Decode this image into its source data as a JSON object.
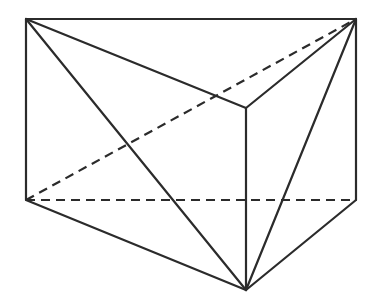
{
  "diagram": {
    "type": "geometry",
    "colors": {
      "stroke": "#2b2b2b",
      "background": "#ffffff"
    },
    "vertices": {
      "top_left": {
        "x": 26,
        "y": 19
      },
      "top_right": {
        "x": 356,
        "y": 19
      },
      "top_front": {
        "x": 246,
        "y": 108
      },
      "bottom_left": {
        "x": 26,
        "y": 200
      },
      "bottom_right": {
        "x": 356,
        "y": 200
      },
      "bottom_front": {
        "x": 246,
        "y": 290
      }
    },
    "edges": [
      {
        "from": "top_left",
        "to": "top_right",
        "style": "solid"
      },
      {
        "from": "top_left",
        "to": "top_front",
        "style": "solid"
      },
      {
        "from": "top_front",
        "to": "top_right",
        "style": "solid"
      },
      {
        "from": "top_left",
        "to": "bottom_left",
        "style": "solid"
      },
      {
        "from": "top_right",
        "to": "bottom_right",
        "style": "solid"
      },
      {
        "from": "top_front",
        "to": "bottom_front",
        "style": "solid"
      },
      {
        "from": "bottom_left",
        "to": "bottom_front",
        "style": "solid"
      },
      {
        "from": "bottom_front",
        "to": "bottom_right",
        "style": "solid"
      },
      {
        "from": "top_left",
        "to": "bottom_front",
        "style": "solid"
      },
      {
        "from": "top_right",
        "to": "bottom_front",
        "style": "solid"
      },
      {
        "from": "bottom_left",
        "to": "bottom_right",
        "style": "dashed"
      },
      {
        "from": "bottom_left",
        "to": "top_right",
        "style": "dashed"
      }
    ],
    "labels": []
  }
}
